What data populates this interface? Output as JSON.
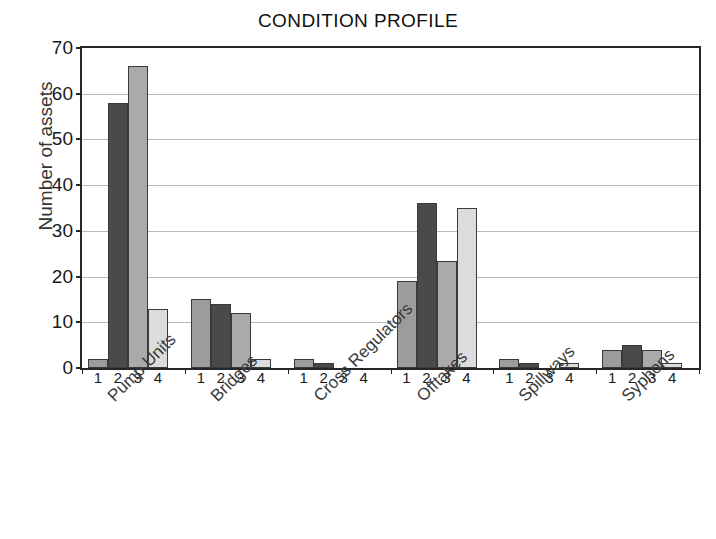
{
  "chart_data": {
    "type": "bar",
    "title": "CONDITION PROFILE",
    "xlabel": "",
    "ylabel": "Number of assets",
    "ylim": [
      0,
      70
    ],
    "ytick_step": 10,
    "yticks": [
      0,
      10,
      20,
      30,
      40,
      50,
      60,
      70
    ],
    "grid": true,
    "legend": "none",
    "categories": [
      "Pump Units",
      "Bridges",
      "Cross Regulators",
      "Offtakes",
      "Spillways",
      "Syphons"
    ],
    "condition_ratings": [
      "1",
      "2",
      "3",
      "4"
    ],
    "series": [
      {
        "name": "1",
        "color": "#9c9c9c",
        "values": [
          2,
          15,
          2,
          19,
          2,
          4
        ]
      },
      {
        "name": "2",
        "color": "#4a4a4a",
        "values": [
          58,
          14,
          1,
          36,
          1,
          5
        ]
      },
      {
        "name": "3",
        "color": "#aaaaaa",
        "values": [
          66,
          12,
          0,
          23.5,
          0,
          4
        ]
      },
      {
        "name": "4",
        "color": "#dcdcdc",
        "values": [
          13,
          2,
          0,
          35,
          1,
          1
        ]
      }
    ]
  },
  "axis": {
    "y_title": "Number of assets"
  }
}
